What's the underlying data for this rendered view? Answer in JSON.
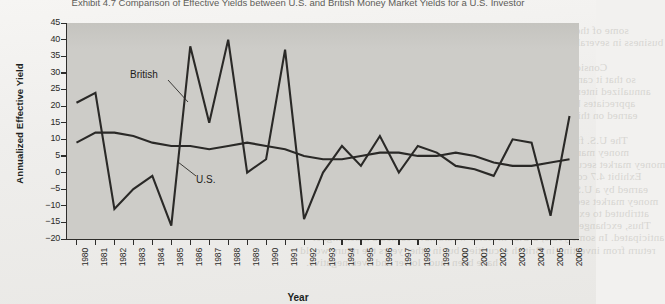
{
  "page": {
    "title": "Exhibit 4.7 Comparison of Effective Yields between U.S. and British Money Market Yields for a U.S. Investor",
    "bleed_through_lines": [
      "some of the assets that are analyzed. It is common for a firm to conduct",
      "business in several different countries, which causes its revenue and expenses",
      "to be subject to various currency movements.",
      "Consider the U.S. firm that uses dollars to purchase British pounds",
      "so that it can invest in a British money market security. Assume that the",
      "annualized interest rate on the British security is 9 percent, and the pound",
      "appreciates by 3 percent over the investment horizon. The effective yield",
      "earned on this investment reflects both the interest rate and the currency",
      "movement.",
      "The U.S. firm may also consider the alternative of investing in the U.S.",
      "money market security. The effective yield from investing in a foreign",
      "money market security can be more or less favorable than investing at home.",
      "Exhibit 4.7 compares the annualized effective yields that would have been",
      "earned by a U.S. investor in a British money market security versus a U.S.",
      "money market security over recent years. The difference in yields is mostly",
      "attributed to exchange rate movements rather than interest rate differentials.",
      "Thus, exchange rate risk can cause returns to be much higher or lower than",
      "anticipated. In some years, a U.S. investor would have earned a much higher",
      "return from investing in British securities, but in other years the return would",
      "have been much lower and even negative."
    ]
  },
  "chart_data": {
    "type": "line",
    "title": "Comparison of Effective Yields between U.S. and British Money Market Yields for a U.S. Investor",
    "xlabel": "Year",
    "ylabel": "Annualized Effective Yield",
    "ylim": [
      -20,
      45
    ],
    "ytick_step": 5,
    "yticks": [
      45,
      40,
      35,
      30,
      25,
      20,
      15,
      10,
      5,
      0,
      -5,
      -10,
      -15,
      -20
    ],
    "grid": false,
    "legend_position": "inline-callout",
    "categories": [
      "1980",
      "1981",
      "1982",
      "1983",
      "1984",
      "1985",
      "1986",
      "1987",
      "1988",
      "1989",
      "1990",
      "1991",
      "1992",
      "1993",
      "1994",
      "1995",
      "1996",
      "1997",
      "1998",
      "1999",
      "2000",
      "2001",
      "2002",
      "2003",
      "2004",
      "2005",
      "2006"
    ],
    "series": [
      {
        "name": "British",
        "label": "British",
        "color": "#2a2927",
        "values": [
          21,
          24,
          -11,
          -5,
          -1,
          -16,
          38,
          15,
          40,
          0,
          4,
          37,
          -14,
          0,
          8,
          2,
          11,
          0,
          8,
          6,
          2,
          1,
          -1,
          10,
          9,
          -13,
          17
        ]
      },
      {
        "name": "U.S.",
        "label": "U.S.",
        "color": "#2a2927",
        "values": [
          9,
          12,
          12,
          11,
          9,
          8,
          8,
          7,
          8,
          9,
          8,
          7,
          5,
          4,
          4,
          5,
          6,
          6,
          5,
          5,
          6,
          5,
          3,
          2,
          2,
          3,
          4
        ]
      }
    ],
    "annotations": [
      {
        "text": "British",
        "x": 1983,
        "y": 33
      },
      {
        "text": "U.S.",
        "x": 1987,
        "y": 0
      }
    ]
  }
}
